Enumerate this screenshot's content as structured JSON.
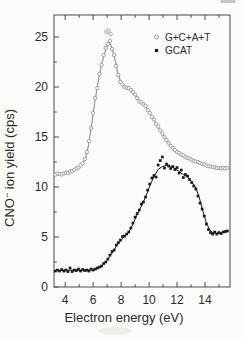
{
  "chart_data": {
    "type": "line+scatter",
    "title": "",
    "xlabel": "Electron energy (eV)",
    "ylabel": "CNO⁻ ion yield (cps)",
    "ylabel_parts": {
      "base": "CNO",
      "superscript": "−",
      "rest": " ion yield (cps)"
    },
    "xlim": [
      3.2,
      15.79
    ],
    "ylim": [
      0,
      27.2
    ],
    "x_major_ticks": [
      4,
      6,
      8,
      10,
      12,
      14
    ],
    "x_minor_ticks": [
      5,
      7,
      9,
      11,
      13,
      15
    ],
    "y_major_ticks": [
      0,
      5,
      10,
      15,
      20,
      25
    ],
    "y_minor_ticks": [
      2.5,
      7.5,
      12.5,
      17.5,
      22.5
    ],
    "x_tick_labels": [
      "4",
      "6",
      "8",
      "10",
      "12",
      "14"
    ],
    "y_tick_labels": [
      "0",
      "5",
      "10",
      "15",
      "20",
      "25"
    ],
    "grid": false,
    "legend_position": "top-right",
    "legend": {
      "entries": [
        {
          "label": "G+C+A+T",
          "marker": "open-circle"
        },
        {
          "label": "GCAT",
          "marker": "filled-square"
        }
      ]
    },
    "colors": {
      "frame": "#4a4a4a",
      "tick_text": "#2b2b2b",
      "series_gcat_sum": "#8f8f8f",
      "series_gcat_film": "#1b1b1b",
      "background": "#fcfcfa"
    },
    "layout": {
      "left": 54,
      "top": 15,
      "right": 230,
      "bottom": 287
    },
    "series": [
      {
        "name": "G+C+A+T",
        "marker": "open-circle",
        "color": "#8f8f8f",
        "line": [
          [
            3.2,
            11.3
          ],
          [
            3.7,
            11.3
          ],
          [
            4.1,
            11.4
          ],
          [
            4.5,
            11.6
          ],
          [
            4.9,
            11.9
          ],
          [
            5.2,
            12.25
          ],
          [
            5.45,
            12.9
          ],
          [
            5.65,
            14.0
          ],
          [
            5.85,
            15.8
          ],
          [
            6.05,
            17.8
          ],
          [
            6.25,
            19.6
          ],
          [
            6.45,
            21.2
          ],
          [
            6.65,
            22.5
          ],
          [
            6.85,
            23.5
          ],
          [
            7.0,
            24.1
          ],
          [
            7.15,
            24.5
          ],
          [
            7.3,
            24.1
          ],
          [
            7.45,
            23.4
          ],
          [
            7.6,
            22.5
          ],
          [
            7.75,
            21.5
          ],
          [
            7.95,
            20.6
          ],
          [
            8.1,
            20.2
          ],
          [
            8.35,
            20.0
          ],
          [
            8.6,
            19.8
          ],
          [
            8.85,
            19.55
          ],
          [
            9.05,
            19.15
          ],
          [
            9.25,
            18.65
          ],
          [
            9.5,
            18.4
          ],
          [
            9.75,
            18.1
          ],
          [
            10.0,
            17.5
          ],
          [
            10.3,
            16.8
          ],
          [
            10.6,
            16.1
          ],
          [
            10.9,
            15.4
          ],
          [
            11.2,
            14.8
          ],
          [
            11.5,
            14.2
          ],
          [
            11.8,
            13.75
          ],
          [
            12.1,
            13.45
          ],
          [
            12.4,
            13.2
          ],
          [
            12.7,
            12.95
          ],
          [
            13.0,
            12.8
          ],
          [
            13.3,
            12.6
          ],
          [
            13.6,
            12.45
          ],
          [
            13.9,
            12.3
          ],
          [
            14.2,
            12.15
          ],
          [
            14.5,
            12.05
          ],
          [
            14.8,
            11.95
          ],
          [
            15.1,
            11.9
          ],
          [
            15.4,
            11.85
          ],
          [
            15.65,
            11.85
          ]
        ],
        "points": [
          [
            3.3,
            11.25
          ],
          [
            3.45,
            11.35
          ],
          [
            3.6,
            11.3
          ],
          [
            3.75,
            11.25
          ],
          [
            3.9,
            11.35
          ],
          [
            4.05,
            11.45
          ],
          [
            4.2,
            11.4
          ],
          [
            4.35,
            11.55
          ],
          [
            4.5,
            11.6
          ],
          [
            4.65,
            11.7
          ],
          [
            4.8,
            11.85
          ],
          [
            4.95,
            11.95
          ],
          [
            5.1,
            12.15
          ],
          [
            5.25,
            12.35
          ],
          [
            5.4,
            12.8
          ],
          [
            5.55,
            13.5
          ],
          [
            5.7,
            14.6
          ],
          [
            5.85,
            15.9
          ],
          [
            6.0,
            17.4
          ],
          [
            6.15,
            18.9
          ],
          [
            6.3,
            19.9
          ],
          [
            6.45,
            21.3
          ],
          [
            6.6,
            22.2
          ],
          [
            6.75,
            23.2
          ],
          [
            6.9,
            23.9
          ],
          [
            6.95,
            25.5
          ],
          [
            7.05,
            24.3
          ],
          [
            7.1,
            25.65
          ],
          [
            7.2,
            24.6
          ],
          [
            7.25,
            25.3
          ],
          [
            7.35,
            23.8
          ],
          [
            7.5,
            23.2
          ],
          [
            7.65,
            22.1
          ],
          [
            7.8,
            21.2
          ],
          [
            7.95,
            20.5
          ],
          [
            8.1,
            20.25
          ],
          [
            8.25,
            20.0
          ],
          [
            8.4,
            19.9
          ],
          [
            8.55,
            19.9
          ],
          [
            8.7,
            19.7
          ],
          [
            8.85,
            19.5
          ],
          [
            9.0,
            19.25
          ],
          [
            9.15,
            18.9
          ],
          [
            9.3,
            18.55
          ],
          [
            9.45,
            18.45
          ],
          [
            9.6,
            18.3
          ],
          [
            9.75,
            18.1
          ],
          [
            9.9,
            17.7
          ],
          [
            10.05,
            17.4
          ],
          [
            10.2,
            17.0
          ],
          [
            10.35,
            16.75
          ],
          [
            10.5,
            16.3
          ],
          [
            10.65,
            16.05
          ],
          [
            10.8,
            15.65
          ],
          [
            10.95,
            15.35
          ],
          [
            11.1,
            15.0
          ],
          [
            11.25,
            14.7
          ],
          [
            11.4,
            14.4
          ],
          [
            11.55,
            14.1
          ],
          [
            11.7,
            13.9
          ],
          [
            11.85,
            13.7
          ],
          [
            12.0,
            13.5
          ],
          [
            12.15,
            13.4
          ],
          [
            12.3,
            13.25
          ],
          [
            12.45,
            13.15
          ],
          [
            12.6,
            13.0
          ],
          [
            12.75,
            12.9
          ],
          [
            12.9,
            12.85
          ],
          [
            13.05,
            12.7
          ],
          [
            13.2,
            12.6
          ],
          [
            13.35,
            12.55
          ],
          [
            13.5,
            12.5
          ],
          [
            13.65,
            12.4
          ],
          [
            13.8,
            12.3
          ],
          [
            13.95,
            12.25
          ],
          [
            14.1,
            12.15
          ],
          [
            14.25,
            12.1
          ],
          [
            14.4,
            12.05
          ],
          [
            14.55,
            12.0
          ],
          [
            14.7,
            11.95
          ],
          [
            14.85,
            11.9
          ],
          [
            15.0,
            11.9
          ],
          [
            15.15,
            11.85
          ],
          [
            15.3,
            11.9
          ],
          [
            15.45,
            11.85
          ],
          [
            15.6,
            11.9
          ]
        ]
      },
      {
        "name": "GCAT",
        "marker": "filled-square",
        "color": "#1b1b1b",
        "line": [
          [
            3.2,
            1.65
          ],
          [
            3.7,
            1.65
          ],
          [
            4.2,
            1.68
          ],
          [
            4.7,
            1.68
          ],
          [
            5.2,
            1.7
          ],
          [
            5.7,
            1.7
          ],
          [
            6.1,
            1.78
          ],
          [
            6.45,
            1.95
          ],
          [
            6.75,
            2.25
          ],
          [
            7.05,
            2.75
          ],
          [
            7.35,
            3.4
          ],
          [
            7.65,
            4.05
          ],
          [
            7.95,
            4.6
          ],
          [
            8.25,
            5.05
          ],
          [
            8.55,
            5.5
          ],
          [
            8.85,
            6.3
          ],
          [
            9.15,
            7.25
          ],
          [
            9.45,
            8.1
          ],
          [
            9.75,
            9.0
          ],
          [
            10.05,
            10.1
          ],
          [
            10.35,
            11.05
          ],
          [
            10.65,
            11.75
          ],
          [
            10.95,
            12.05
          ],
          [
            11.25,
            12.15
          ],
          [
            11.55,
            12.05
          ],
          [
            11.85,
            11.85
          ],
          [
            12.15,
            11.55
          ],
          [
            12.45,
            11.25
          ],
          [
            12.75,
            11.0
          ],
          [
            13.05,
            10.55
          ],
          [
            13.35,
            9.9
          ],
          [
            13.6,
            8.9
          ],
          [
            13.85,
            7.6
          ],
          [
            14.1,
            6.4
          ],
          [
            14.35,
            5.7
          ],
          [
            14.6,
            5.4
          ],
          [
            14.9,
            5.35
          ],
          [
            15.2,
            5.45
          ],
          [
            15.5,
            5.55
          ],
          [
            15.65,
            5.6
          ]
        ],
        "points": [
          [
            3.3,
            1.6
          ],
          [
            3.45,
            1.7
          ],
          [
            3.6,
            1.6
          ],
          [
            3.75,
            1.75
          ],
          [
            3.9,
            1.6
          ],
          [
            4.05,
            1.7
          ],
          [
            4.2,
            1.55
          ],
          [
            4.35,
            1.9
          ],
          [
            4.5,
            1.55
          ],
          [
            4.65,
            1.7
          ],
          [
            4.8,
            1.65
          ],
          [
            4.95,
            1.8
          ],
          [
            5.1,
            1.6
          ],
          [
            5.25,
            1.75
          ],
          [
            5.4,
            1.65
          ],
          [
            5.55,
            1.7
          ],
          [
            5.7,
            1.6
          ],
          [
            5.85,
            1.8
          ],
          [
            6.0,
            1.7
          ],
          [
            6.15,
            1.8
          ],
          [
            6.3,
            1.9
          ],
          [
            6.45,
            2.0
          ],
          [
            6.6,
            2.1
          ],
          [
            6.75,
            2.35
          ],
          [
            6.9,
            2.5
          ],
          [
            7.05,
            2.8
          ],
          [
            7.2,
            3.2
          ],
          [
            7.35,
            3.55
          ],
          [
            7.5,
            3.7
          ],
          [
            7.65,
            4.2
          ],
          [
            7.8,
            4.45
          ],
          [
            7.95,
            4.7
          ],
          [
            8.1,
            5.05
          ],
          [
            8.25,
            5.1
          ],
          [
            8.4,
            5.3
          ],
          [
            8.55,
            5.5
          ],
          [
            8.7,
            5.9
          ],
          [
            8.85,
            6.4
          ],
          [
            9.0,
            7.0
          ],
          [
            9.15,
            7.35
          ],
          [
            9.3,
            7.7
          ],
          [
            9.45,
            8.3
          ],
          [
            9.6,
            8.5
          ],
          [
            9.75,
            9.0
          ],
          [
            9.9,
            9.7
          ],
          [
            10.05,
            10.3
          ],
          [
            10.2,
            10.9
          ],
          [
            10.35,
            11.15
          ],
          [
            10.5,
            11.0
          ],
          [
            10.65,
            12.2
          ],
          [
            10.8,
            12.65
          ],
          [
            10.95,
            13.0
          ],
          [
            11.1,
            11.9
          ],
          [
            11.25,
            12.3
          ],
          [
            11.4,
            12.1
          ],
          [
            11.55,
            11.85
          ],
          [
            11.7,
            12.05
          ],
          [
            11.85,
            11.75
          ],
          [
            12.0,
            11.95
          ],
          [
            12.15,
            11.4
          ],
          [
            12.3,
            11.7
          ],
          [
            12.45,
            10.95
          ],
          [
            12.6,
            11.25
          ],
          [
            12.75,
            11.1
          ],
          [
            12.9,
            10.75
          ],
          [
            13.05,
            10.45
          ],
          [
            13.2,
            10.1
          ],
          [
            13.35,
            9.8
          ],
          [
            13.5,
            9.1
          ],
          [
            13.65,
            8.4
          ],
          [
            13.8,
            7.8
          ],
          [
            13.95,
            7.1
          ],
          [
            14.1,
            6.3
          ],
          [
            14.25,
            5.75
          ],
          [
            14.4,
            5.45
          ],
          [
            14.55,
            5.3
          ],
          [
            14.7,
            5.5
          ],
          [
            14.85,
            5.3
          ],
          [
            15.0,
            5.45
          ],
          [
            15.15,
            5.35
          ],
          [
            15.3,
            5.5
          ],
          [
            15.45,
            5.55
          ],
          [
            15.6,
            5.6
          ]
        ]
      }
    ]
  }
}
